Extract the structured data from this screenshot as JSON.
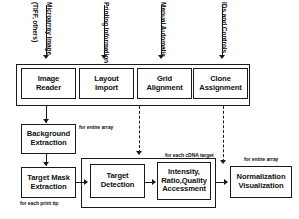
{
  "diagram": {
    "inputs": [
      {
        "name": "microarray-image",
        "label": "Microarray Image",
        "sublabel": "(TIFF, others)"
      },
      {
        "name": "printing-information",
        "label": "Printing Information",
        "sublabel": ""
      },
      {
        "name": "manual-automatic",
        "label": "Manual Automatic",
        "sublabel": ""
      },
      {
        "name": "ids-and-controls",
        "label": "IDs and Controls",
        "sublabel": ""
      }
    ],
    "row1": [
      {
        "name": "image-reader",
        "line1": "Image",
        "line2": "Reader"
      },
      {
        "name": "layout-import",
        "line1": "Layout",
        "line2": "Import"
      },
      {
        "name": "grid-alignment",
        "line1": "Grid",
        "line2": "Alignment"
      },
      {
        "name": "clone-assignment",
        "line1": "Clone",
        "line2": "Assignment"
      }
    ],
    "nodes": {
      "background_extraction": {
        "line1": "Background",
        "line2": "Extraction"
      },
      "target_mask_extraction": {
        "line1": "Target Mask",
        "line2": "Extraction"
      },
      "target_detection": {
        "line1": "Target",
        "line2": "Detection"
      },
      "intensity_assessment": {
        "line1": "Intensity,",
        "line2": "Ratio,Quality",
        "line3": "Accessment"
      },
      "normalization_visualization": {
        "line1": "Normalization",
        "line2": "Visualization"
      }
    },
    "captions": {
      "entire_array_top": "for entire array",
      "each_print_tip": "for each print tip",
      "each_cdna_target": "for each cDNA target",
      "entire_array_right": "for entire array"
    },
    "colors": {
      "stroke": "#1a1a1a",
      "background": "#ffffff"
    }
  }
}
